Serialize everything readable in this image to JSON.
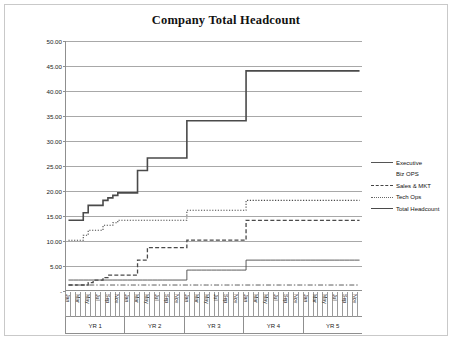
{
  "chart_data": {
    "type": "line",
    "title": "Company Total Headcount",
    "xlabel": "",
    "ylabel": "",
    "ylim": [
      0,
      50
    ],
    "ytick_labels": [
      "-",
      "5.00",
      "10.00",
      "15.00",
      "20.00",
      "25.00",
      "30.00",
      "35.00",
      "40.00",
      "45.00",
      "50.00"
    ],
    "ytick_values": [
      0,
      5,
      10,
      15,
      20,
      25,
      30,
      35,
      40,
      45,
      50
    ],
    "grid": true,
    "legend_position": "right",
    "x_group_labels": [
      "YR 1",
      "YR 2",
      "YR 3",
      "YR 4",
      "YR 5"
    ],
    "x_month_labels": [
      "Jan",
      "",
      "Mar",
      "",
      "May",
      "",
      "Jul",
      "",
      "Sep",
      "",
      "Nov",
      ""
    ],
    "months_per_year": 12,
    "x": [
      1,
      2,
      3,
      4,
      5,
      6,
      7,
      8,
      9,
      10,
      11,
      12,
      13,
      14,
      15,
      16,
      17,
      18,
      19,
      20,
      21,
      22,
      23,
      24,
      25,
      26,
      27,
      28,
      29,
      30,
      31,
      32,
      33,
      34,
      35,
      36,
      37,
      38,
      39,
      40,
      41,
      42,
      43,
      44,
      45,
      46,
      47,
      48,
      49,
      50,
      51,
      52,
      53,
      54,
      55,
      56,
      57,
      58,
      59,
      60
    ],
    "series": [
      {
        "name": "Executive",
        "style": "solid-thin",
        "values": [
          2,
          2,
          2,
          2,
          2,
          2,
          2,
          2,
          2,
          2,
          2,
          2,
          2,
          2,
          2,
          2,
          2,
          2,
          2,
          2,
          2,
          2,
          2,
          2,
          4,
          4,
          4,
          4,
          4,
          4,
          4,
          4,
          4,
          4,
          4,
          4,
          6,
          6,
          6,
          6,
          6,
          6,
          6,
          6,
          6,
          6,
          6,
          6,
          6,
          6,
          6,
          6,
          6,
          6,
          6,
          6,
          6,
          6,
          6,
          6
        ]
      },
      {
        "name": "Biz OPS",
        "style": "dash-dot",
        "values": [
          1,
          1,
          1,
          1,
          1,
          1,
          1,
          1,
          1,
          1,
          1,
          1,
          1,
          1,
          1,
          1,
          1,
          1,
          1,
          1,
          1,
          1,
          1,
          1,
          1,
          1,
          1,
          1,
          1,
          1,
          1,
          1,
          1,
          1,
          1,
          1,
          1,
          1,
          1,
          1,
          1,
          1,
          1,
          1,
          1,
          1,
          1,
          1,
          1,
          1,
          1,
          1,
          1,
          1,
          1,
          1,
          1,
          1,
          1,
          1
        ]
      },
      {
        "name": "Sales & MKT",
        "style": "dashed",
        "values": [
          1,
          1,
          1,
          1,
          1.5,
          2,
          2,
          2.5,
          3,
          3,
          3,
          3,
          3,
          3,
          6,
          6,
          8.5,
          8.5,
          8.5,
          8.5,
          8.5,
          8.5,
          8.5,
          8.5,
          10,
          10,
          10,
          10,
          10,
          10,
          10,
          10,
          10,
          10,
          10,
          10,
          14,
          14,
          14,
          14,
          14,
          14,
          14,
          14,
          14,
          14,
          14,
          14,
          14,
          14,
          14,
          14,
          14,
          14,
          14,
          14,
          14,
          14,
          14,
          14
        ]
      },
      {
        "name": "Tech Ops",
        "style": "dotted",
        "values": [
          10,
          10,
          10,
          11,
          12,
          12,
          12,
          13,
          13,
          13.5,
          14,
          14,
          14,
          14,
          14,
          14,
          14,
          14,
          14,
          14,
          14,
          14,
          14,
          14,
          16,
          16,
          16,
          16,
          16,
          16,
          16,
          16,
          16,
          16,
          16,
          16,
          18,
          18,
          18,
          18,
          18,
          18,
          18,
          18,
          18,
          18,
          18,
          18,
          18,
          18,
          18,
          18,
          18,
          18,
          18,
          18,
          18,
          18,
          18,
          18
        ]
      },
      {
        "name": "Total Headcount",
        "style": "solid-thick",
        "values": [
          14,
          14,
          14,
          15.5,
          17,
          17,
          17,
          18,
          18.5,
          19,
          19.5,
          19.5,
          19.5,
          19.5,
          24,
          24,
          26.5,
          26.5,
          26.5,
          26.5,
          26.5,
          26.5,
          26.5,
          26.5,
          34,
          34,
          34,
          34,
          34,
          34,
          34,
          34,
          34,
          34,
          34,
          34,
          44,
          44,
          44,
          44,
          44,
          44,
          44,
          44,
          44,
          44,
          44,
          44,
          44,
          44,
          44,
          44,
          44,
          44,
          44,
          44,
          44,
          44,
          44,
          44
        ]
      }
    ]
  },
  "legend": {
    "items": [
      {
        "label": "Executive",
        "style": "solid-thin"
      },
      {
        "label": "Biz OPS",
        "style": "dash-dot"
      },
      {
        "label": "Sales & MKT",
        "style": "dashed"
      },
      {
        "label": "Tech Ops",
        "style": "dotted"
      },
      {
        "label": "Total Headcount",
        "style": "solid-thick"
      }
    ]
  },
  "colors": {
    "grid": "#a8a8a8",
    "axis": "#8f8f8f",
    "series": "#4a4a4a",
    "frame": "#c9c9c9",
    "text": "#111111"
  }
}
